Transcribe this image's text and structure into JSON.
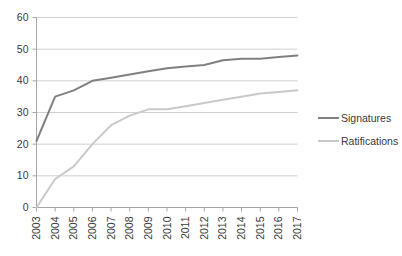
{
  "chart_data": {
    "type": "line",
    "title": "",
    "subtitle": "",
    "xlabel": "",
    "ylabel": "",
    "categories": [
      "2003",
      "2004",
      "2005",
      "2006",
      "2007",
      "2008",
      "2009",
      "2010",
      "2011",
      "2012",
      "2013",
      "2014",
      "2015",
      "2016",
      "2017"
    ],
    "series": [
      {
        "name": "Signatures",
        "color": "#808080",
        "values": [
          21,
          35,
          37,
          40,
          41,
          42,
          43,
          44,
          44.5,
          45,
          46.5,
          47,
          47,
          47.5,
          48
        ]
      },
      {
        "name": "Ratifications",
        "color": "#c9c9c9",
        "values": [
          0,
          9,
          13,
          20,
          26,
          29,
          31,
          31,
          32,
          33,
          34,
          35,
          36,
          36.5,
          37
        ]
      }
    ],
    "ylim": [
      0,
      60
    ],
    "yticks": [
      0,
      10,
      20,
      30,
      40,
      50,
      60
    ],
    "ytick_labels": [
      "0",
      "10",
      "20",
      "30",
      "40",
      "50",
      "60"
    ],
    "grid": "horizontal",
    "legend_position": "right",
    "axis_color": "#a6a6a6",
    "grid_color": "#d0d0d0",
    "background": "#ffffff"
  },
  "legend": {
    "items": [
      {
        "label": "Signatures",
        "color": "#808080"
      },
      {
        "label": "Ratifications",
        "color": "#c9c9c9"
      }
    ]
  },
  "axes": {
    "y_tick_labels": [
      "60",
      "50",
      "40",
      "30",
      "20",
      "10",
      "0"
    ],
    "x_tick_labels": [
      "2003",
      "2004",
      "2005",
      "2006",
      "2007",
      "2008",
      "2009",
      "2010",
      "2011",
      "2012",
      "2013",
      "2014",
      "2015",
      "2016",
      "2017"
    ]
  }
}
